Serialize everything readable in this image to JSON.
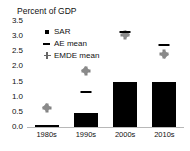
{
  "chart_data": {
    "type": "bar",
    "title": "Percent of GDP",
    "xlabel": "",
    "ylabel": "",
    "ylim": [
      0.0,
      3.5
    ],
    "yticks": [
      "0.0",
      "0.5",
      "1.0",
      "1.5",
      "2.0",
      "2.5",
      "3.0",
      "3.5"
    ],
    "ytick_values": [
      0.0,
      0.5,
      1.0,
      1.5,
      2.0,
      2.5,
      3.0,
      3.5
    ],
    "grid": false,
    "legend_position": "upper-left-inside",
    "categories": [
      "1980s",
      "1990s",
      "2000s",
      "2010s"
    ],
    "series": [
      {
        "name": "SAR",
        "marker": "filled-square-bar",
        "color": "#000000",
        "values": [
          0.06,
          0.45,
          1.5,
          1.47
        ]
      },
      {
        "name": "AE mean",
        "marker": "dash",
        "color": "#000000",
        "values": [
          null,
          1.17,
          3.15,
          2.72
        ]
      },
      {
        "name": "EMDE mean",
        "marker": "plus",
        "color": "#808080",
        "values": [
          0.63,
          1.85,
          3.05,
          2.4
        ]
      }
    ]
  },
  "legend": {
    "items": [
      {
        "label": "SAR",
        "key": "square-marker-icon"
      },
      {
        "label": "AE mean",
        "key": "dash-marker-icon"
      },
      {
        "label": "EMDE mean",
        "key": "plus-marker-icon"
      }
    ]
  },
  "colors": {
    "bar": "#000000",
    "ae_mean": "#000000",
    "emde_mean": "#808080",
    "axis": "#b8b8b8",
    "background": "#ffffff",
    "text": "#111111"
  }
}
